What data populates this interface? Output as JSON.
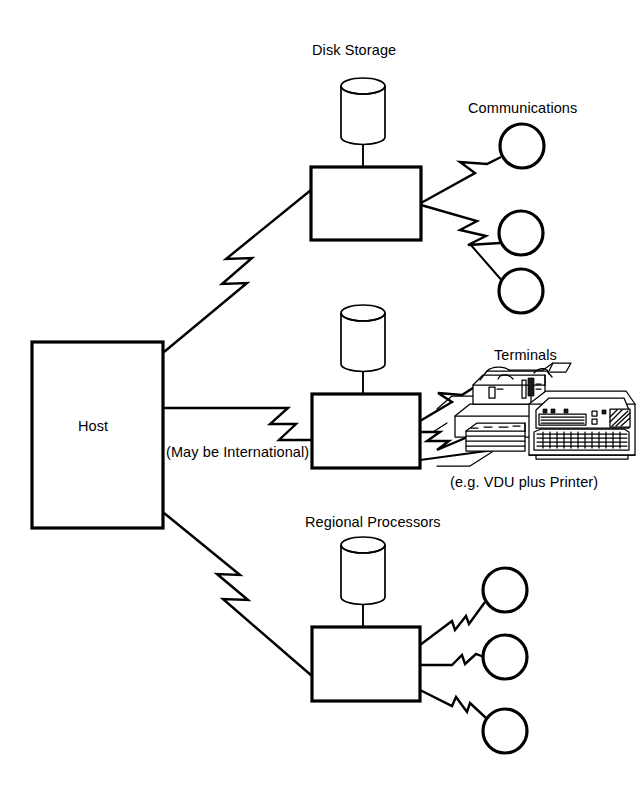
{
  "diagram": {
    "title_labels": {
      "disk_storage": "Disk Storage",
      "communications": "Communications",
      "terminals": "Terminals",
      "regional_processors": "Regional Processors"
    },
    "nodes": {
      "host": {
        "label": "Host",
        "shape": "rectangle"
      },
      "comms_processor": {
        "label": "",
        "shape": "rectangle"
      },
      "terminal_processor": {
        "label": "",
        "shape": "rectangle"
      },
      "regional_processor": {
        "label": "",
        "shape": "rectangle"
      }
    },
    "annotations": {
      "may_be_international": "(May be International)",
      "vdu_plus_printer": "(e.g. VDU plus Printer)"
    },
    "icons": {
      "disk_cylinder": "disk-cylinder-icon",
      "comms_node": "circle-node-icon",
      "terminal_art": "terminal-illustration-icon",
      "zigzag_link": "zigzag-link-icon"
    },
    "colors": {
      "ink": "#000000",
      "paper": "#ffffff"
    }
  }
}
